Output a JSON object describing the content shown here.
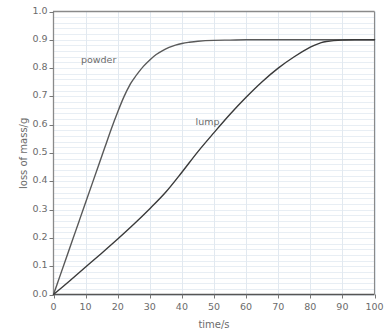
{
  "chart_data": {
    "type": "line",
    "title": "",
    "xlabel": "time/s",
    "ylabel": "loss of mass/g",
    "xlim": [
      0,
      100
    ],
    "ylim": [
      0,
      1.0
    ],
    "xticks": [
      0,
      10,
      20,
      30,
      40,
      50,
      60,
      70,
      80,
      90,
      100
    ],
    "xtick_labels": [
      "0",
      "10",
      "20",
      "30",
      "40",
      "50",
      "60",
      "70",
      "80",
      "90",
      "100"
    ],
    "yticks": [
      0.0,
      0.1,
      0.2,
      0.3,
      0.4,
      0.5,
      0.6,
      0.7,
      0.8,
      0.9,
      1.0
    ],
    "ytick_labels": [
      "0.0",
      "0.1",
      "0.2",
      "0.3",
      "0.4",
      "0.5",
      "0.6",
      "0.7",
      "0.8",
      "0.9",
      "1.0"
    ],
    "grid": {
      "horizontal": true,
      "vertical": true,
      "horizontal_step": 0.02,
      "vertical_step": 10,
      "color": "#e8eef4"
    },
    "legend": "inline-annotations",
    "legend_position": "none",
    "series": [
      {
        "name": "powder",
        "color": "#595959",
        "label_x": 14,
        "label_y": 0.825,
        "x": [
          0,
          2,
          4,
          6,
          8,
          10,
          12,
          14,
          16,
          18,
          20,
          22,
          24,
          25,
          26,
          28,
          30,
          32,
          34,
          36,
          38,
          40,
          42,
          45,
          50,
          55,
          60,
          65,
          70,
          75,
          80,
          85,
          90,
          95,
          100
        ],
        "y": [
          0.0,
          0.065,
          0.13,
          0.195,
          0.26,
          0.325,
          0.39,
          0.455,
          0.52,
          0.585,
          0.645,
          0.7,
          0.745,
          0.762,
          0.778,
          0.806,
          0.829,
          0.848,
          0.862,
          0.873,
          0.881,
          0.887,
          0.891,
          0.895,
          0.898,
          0.899,
          0.9,
          0.9,
          0.9,
          0.9,
          0.9,
          0.9,
          0.9,
          0.9,
          0.9
        ]
      },
      {
        "name": "lump",
        "color": "#3a3a3a",
        "label_x": 48,
        "label_y": 0.605,
        "x": [
          0,
          5,
          10,
          15,
          20,
          25,
          30,
          35,
          40,
          45,
          50,
          55,
          60,
          65,
          70,
          75,
          80,
          83,
          85,
          90,
          95,
          100
        ],
        "y": [
          0.0,
          0.048,
          0.097,
          0.146,
          0.196,
          0.248,
          0.303,
          0.362,
          0.432,
          0.505,
          0.572,
          0.637,
          0.697,
          0.752,
          0.8,
          0.84,
          0.874,
          0.888,
          0.894,
          0.899,
          0.9,
          0.9
        ]
      }
    ],
    "annotations": [
      {
        "text": "powder",
        "x": 14,
        "y": 0.825
      },
      {
        "text": "lump",
        "x": 48,
        "y": 0.605
      }
    ]
  },
  "axes": {
    "frame_color": "#8a8a8a",
    "background": "#ffffff"
  }
}
